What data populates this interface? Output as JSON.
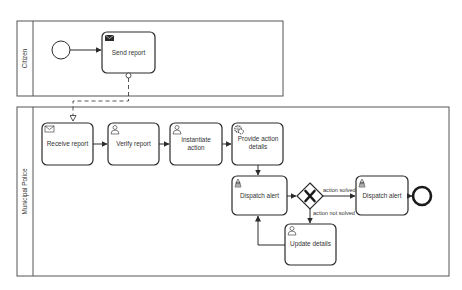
{
  "pools": [
    {
      "name": "Citizen"
    },
    {
      "name": "Municipal Police"
    }
  ],
  "tasks": {
    "send_report": {
      "label": "Send report",
      "type": "send"
    },
    "receive_report": {
      "label": "Receive report",
      "type": "receive"
    },
    "verify_report": {
      "label_lines": [
        "Verify report"
      ],
      "type": "user"
    },
    "instantiate_action": {
      "label_lines": [
        "Instantiate",
        "action"
      ],
      "type": "user"
    },
    "provide_action_details": {
      "label_lines": [
        "Provide action",
        "details"
      ],
      "type": "service"
    },
    "dispatch_alert_1": {
      "label": "Dispatch alert",
      "type": "script"
    },
    "dispatch_alert_2": {
      "label": "Dispatch alert",
      "type": "script"
    },
    "update_details": {
      "label": "Update details",
      "type": "user"
    }
  },
  "gateway": {
    "type": "exclusive",
    "symbol": "X"
  },
  "flows": {
    "solved": "action solved",
    "not_solved": "action not solved"
  },
  "colors": {
    "stroke": "#2b2b2b",
    "pool_border": "#555555",
    "text": "#333333"
  }
}
